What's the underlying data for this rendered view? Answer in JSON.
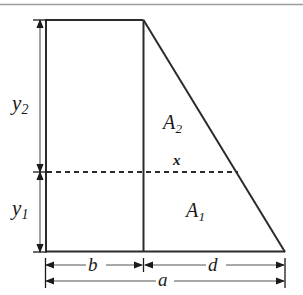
{
  "figure": {
    "kind": "geometry-diagram",
    "background_color": "#ffffff",
    "line_color": "#2b2b2b",
    "dimension_line_color": "#555555",
    "top_rule": {
      "name": "top-rule",
      "visible": true,
      "color": "#9a9a9a"
    },
    "shape": {
      "outline_name": "trapezoid-outline",
      "vertices": {
        "top_left": [
          45,
          20
        ],
        "top_right": [
          143,
          20
        ],
        "bottom_right": [
          285,
          252
        ],
        "bottom_left": [
          45,
          252
        ]
      },
      "interior_divider_name": "rectangle-right-edge",
      "interior_divider_x": 143
    },
    "dashed_line": {
      "name": "dashed-division-line",
      "y": 172,
      "x_start": 46,
      "x_end": 238,
      "style": "dashed"
    },
    "regions": [
      {
        "id": "A2",
        "label": "A",
        "subscript": "2",
        "name": "region-label-a2"
      },
      {
        "id": "A1",
        "label": "A",
        "subscript": "1",
        "name": "region-label-a1"
      }
    ],
    "vertical_dimensions": [
      {
        "id": "y2",
        "label": "y",
        "subscript": "2",
        "name": "dimension-label-y2",
        "x": 40,
        "y_top": 20,
        "y_bottom": 172
      },
      {
        "id": "y1",
        "label": "y",
        "subscript": "1",
        "name": "dimension-label-y1",
        "x": 40,
        "y_top": 172,
        "y_bottom": 252
      }
    ],
    "horizontal_dimensions": [
      {
        "id": "b",
        "label": "b",
        "name": "dimension-label-b",
        "y": 265,
        "x_start": 45,
        "x_end": 143
      },
      {
        "id": "d",
        "label": "d",
        "name": "dimension-label-d",
        "y": 265,
        "x_start": 143,
        "x_end": 285
      },
      {
        "id": "a",
        "label": "a",
        "name": "dimension-label-a",
        "y": 281,
        "x_start": 45,
        "x_end": 285
      }
    ],
    "point_labels": [
      {
        "id": "x",
        "label": "x",
        "name": "point-label-x"
      }
    ]
  }
}
